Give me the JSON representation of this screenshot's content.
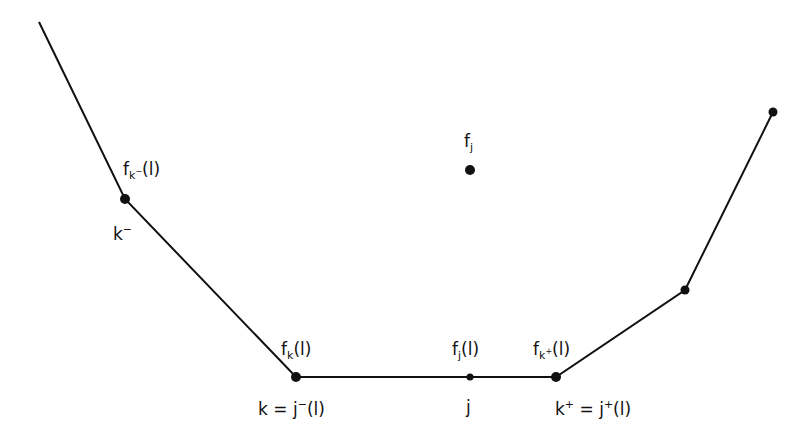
{
  "diagram": {
    "title": "",
    "polyline_nodes": [
      {
        "id": "start",
        "dot": "none"
      },
      {
        "id": "k_minus",
        "dot": "large"
      },
      {
        "id": "k",
        "dot": "large"
      },
      {
        "id": "j",
        "dot": "small"
      },
      {
        "id": "k_plus",
        "dot": "large"
      },
      {
        "id": "right1",
        "dot": "medium"
      },
      {
        "id": "right2",
        "dot": "medium"
      }
    ],
    "isolated_points": [
      {
        "id": "f_j",
        "dot": "large"
      }
    ],
    "labels": {
      "f_k_minus_l": {
        "base": "f",
        "sub": "k",
        "subsup": "−",
        "arg": "(l)"
      },
      "k_minus": {
        "base": "k",
        "sup": "−"
      },
      "f_j": {
        "base": "f",
        "sub": "j"
      },
      "f_k_l": {
        "base": "f",
        "sub": "k",
        "arg": "(l)"
      },
      "k_eq_j_minus_l": {
        "lhs": "k",
        "eq": " = ",
        "rhs": "j",
        "sup": "−",
        "arg": "(l)"
      },
      "f_j_l": {
        "base": "f",
        "sub": "j",
        "arg": "(l)"
      },
      "j": {
        "base": "j"
      },
      "f_k_plus_l": {
        "base": "f",
        "sub": "k",
        "subsup": "+",
        "arg": "(l)"
      },
      "k_plus_eq_j_plus_l": {
        "lhs": "k",
        "lhs_sup": "+",
        "eq": " = ",
        "rhs": "j",
        "sup": "+",
        "arg": "(l)"
      }
    },
    "colors": {
      "stroke": "#111111",
      "background": "#ffffff"
    }
  }
}
